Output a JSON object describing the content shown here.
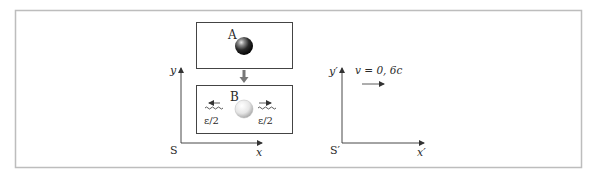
{
  "figure": {
    "frame_color": "#bfbfbf",
    "ink_color": "#333333",
    "box_A": {
      "label": "A",
      "sphere": "dark-sphere"
    },
    "transition_arrow": "down-arrow",
    "box_B": {
      "label": "B",
      "sphere": "light-sphere",
      "left_photon": {
        "label": "ε/2",
        "direction": "left"
      },
      "right_photon": {
        "label": "ε/2",
        "direction": "right"
      }
    },
    "frame_S": {
      "origin_label": "S",
      "x_label": "x",
      "y_label": "y"
    },
    "frame_S_prime": {
      "origin_label": "S′",
      "x_label": "x′",
      "y_label": "y′",
      "velocity_label": "v = 0, 6c",
      "velocity_direction": "right"
    }
  }
}
